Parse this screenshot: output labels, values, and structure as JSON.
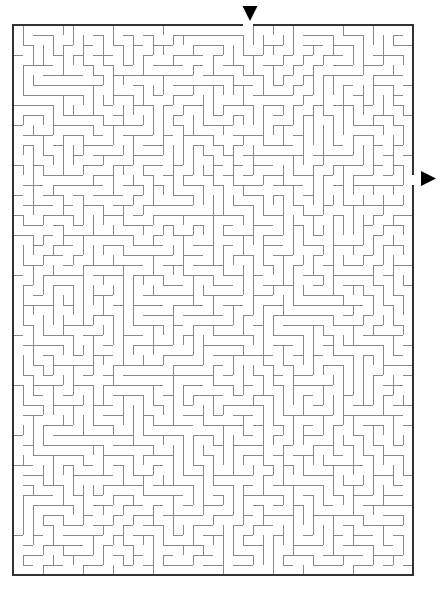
{
  "page": {
    "background_color": "#ffffff",
    "width": 447,
    "height": 592
  },
  "maze": {
    "type": "rectangular-perfect-maze",
    "origin_x": 13,
    "origin_y": 25,
    "cell_size": 10,
    "cols": 40,
    "rows": 55,
    "wall_color": "#8a8a8a",
    "wall_width": 1,
    "border_color": "#333333",
    "border_width": 2,
    "background_color": "#ffffff",
    "entrance": {
      "label": "entrance",
      "side": "top",
      "cell_col": 23,
      "marker": "triangle-down",
      "marker_color": "#000000",
      "marker_x": 250,
      "marker_y": 6,
      "marker_size": 15
    },
    "exit": {
      "label": "exit",
      "side": "right",
      "cell_row": 15,
      "marker": "triangle-right",
      "marker_color": "#000000",
      "marker_x": 421,
      "marker_y": 171,
      "marker_size": 15
    },
    "seed": 20240517
  }
}
